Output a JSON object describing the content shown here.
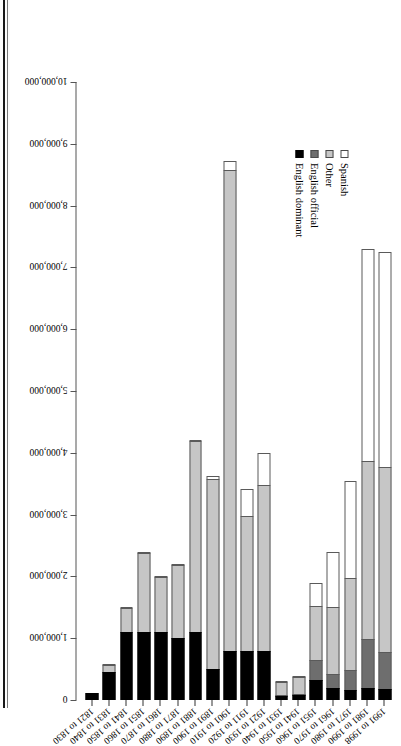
{
  "figure": {
    "orientation": "page-rotated-90",
    "legend_position": "upper-left-inside"
  },
  "legend": {
    "items": [
      {
        "label": "Spanish",
        "key": "spanish",
        "color": "#ffffff",
        "swatch": "legend-swatch-spanish"
      },
      {
        "label": "Other",
        "key": "other",
        "color": "#c6c6c6",
        "swatch": "legend-swatch-other"
      },
      {
        "label": "English official",
        "key": "english_off",
        "color": "#6e6e6e",
        "swatch": "legend-swatch-english-official"
      },
      {
        "label": "English dominant",
        "key": "english_dom",
        "color": "#000000",
        "swatch": "legend-swatch-english-dominant"
      }
    ]
  },
  "axis": {
    "tick_labels": [
      "10,000,000",
      "9,000,000",
      "8,000,000",
      "7,000,000",
      "6,000,000",
      "5,000,000",
      "4,000,000",
      "3,000,000",
      "2,000,000",
      "1,000,000",
      "0"
    ],
    "tick_values": [
      10000000,
      9000000,
      8000000,
      7000000,
      6000000,
      5000000,
      4000000,
      3000000,
      2000000,
      1000000,
      0
    ],
    "max": 10000000,
    "min": 0,
    "step": 1000000
  },
  "chart_data": {
    "type": "bar",
    "subtype": "stacked-horizontal",
    "title": "",
    "xlabel": "",
    "ylabel": "",
    "xlim": [
      0,
      10000000
    ],
    "grid": false,
    "legend_position": "upper-left",
    "categories": [
      "1991 to 1998",
      "1981 to 1990",
      "1971 to 1980",
      "1961 to 1970",
      "1951 to 1960",
      "1941 to 1950",
      "1931 to 1940",
      "1921 to 1930",
      "1911 to 1920",
      "1901 to 1910",
      "1891 to 1900",
      "1881 to 1890",
      "1871 to 1880",
      "1861 to 1870",
      "1851 to 1860",
      "1841 to 1850",
      "1831 to 1840",
      "1821 to 1830"
    ],
    "series": [
      {
        "name": "English dominant",
        "key": "english_dom",
        "color": "#000000",
        "values": [
          180000,
          200000,
          160000,
          200000,
          330000,
          80000,
          60000,
          800000,
          800000,
          800000,
          500000,
          1100000,
          1000000,
          1100000,
          1100000,
          1100000,
          450000,
          120000
        ]
      },
      {
        "name": "English official",
        "key": "english_off",
        "color": "#6e6e6e",
        "values": [
          620000,
          800000,
          340000,
          240000,
          330000,
          30000,
          30000,
          0,
          0,
          0,
          0,
          0,
          0,
          0,
          0,
          0,
          0,
          0
        ]
      },
      {
        "name": "Other",
        "key": "other",
        "color": "#c6c6c6",
        "values": [
          3000000,
          2900000,
          1500000,
          1100000,
          900000,
          300000,
          230000,
          2700000,
          2200000,
          7800000,
          3100000,
          3100000,
          1200000,
          900000,
          1300000,
          400000,
          130000,
          0
        ]
      },
      {
        "name": "Spanish",
        "key": "spanish",
        "color": "#ffffff",
        "values": [
          3500000,
          3450000,
          1600000,
          900000,
          380000,
          30000,
          10000,
          530000,
          450000,
          150000,
          50000,
          30000,
          10000,
          10000,
          10000,
          10000,
          5000,
          0
        ]
      }
    ],
    "totals": [
      7300000,
      7350000,
      3600000,
      2440000,
      1940000,
      440000,
      330000,
      4030000,
      3450000,
      8750000,
      3650000,
      4230000,
      2210000,
      2010000,
      2410000,
      1510000,
      585000,
      120000
    ]
  }
}
